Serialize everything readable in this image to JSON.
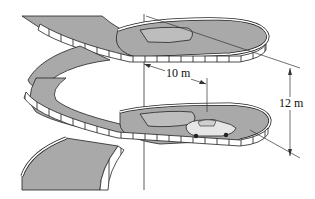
{
  "figure": {
    "colors": {
      "deck": "#a9a9a9",
      "deck_dark": "#8c8c8c",
      "rail": "#ffffff",
      "outline": "#222222",
      "line": "#333333",
      "background": "#ffffff"
    }
  },
  "dimensions": {
    "radius": {
      "label": "10 m"
    },
    "pitch": {
      "label": "12 m"
    }
  }
}
